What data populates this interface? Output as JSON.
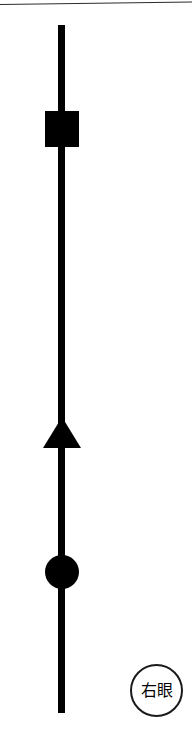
{
  "diagram": {
    "title": "",
    "background_color": "#ffffff",
    "stroke_color": "#000000",
    "width": 192,
    "height": 746,
    "top_rule": {
      "name": "top-border-rule",
      "color": "#2b2b2b"
    },
    "axis": {
      "name": "vertical-axis-line",
      "orientation": "vertical",
      "color": "#000000",
      "thickness_px": 7,
      "top_px": 25,
      "bottom_px": 713
    },
    "markers": [
      {
        "id": "square",
        "shape": "square",
        "label": "",
        "fill": "#000000",
        "center_x_px": 62,
        "center_y_px": 129,
        "size_px": 35
      },
      {
        "id": "triangle",
        "shape": "triangle-up",
        "label": "",
        "fill": "#000000",
        "center_x_px": 62,
        "center_y_px": 433,
        "size_px": 38
      },
      {
        "id": "circle",
        "shape": "circle",
        "label": "",
        "fill": "#000000",
        "center_x_px": 62,
        "center_y_px": 572,
        "size_px": 34
      }
    ],
    "badge": {
      "name": "right-eye-badge",
      "text": "右眼",
      "shape": "circle",
      "border_color": "#1a1a1a",
      "text_color": "#000000",
      "center_x_px": 157,
      "center_y_px": 691,
      "diameter_px": 53
    }
  }
}
